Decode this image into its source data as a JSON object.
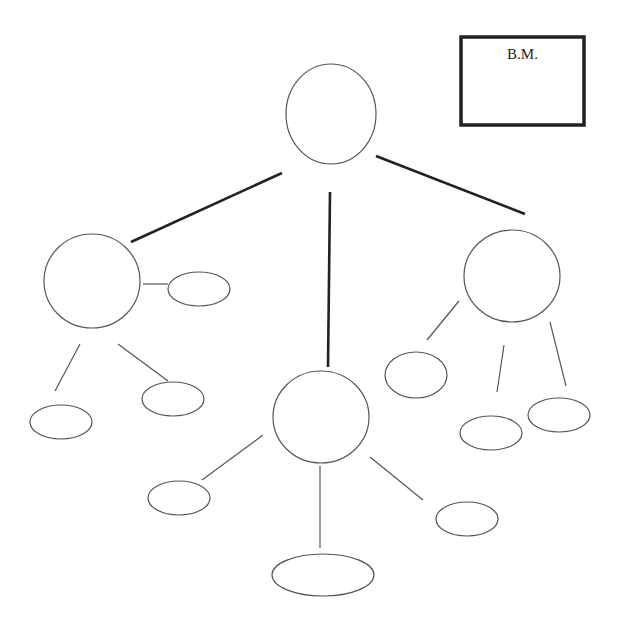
{
  "diagram": {
    "title_box": {
      "label": "B.M.",
      "x": 461,
      "y": 37,
      "w": 123,
      "h": 88,
      "stroke_width": 3.5,
      "color": "#222222"
    },
    "nodes": [
      {
        "id": "root",
        "shape": "ellipse",
        "cx": 331,
        "cy": 114,
        "rx": 45,
        "ry": 50
      },
      {
        "id": "left",
        "shape": "ellipse",
        "cx": 92,
        "cy": 281,
        "rx": 48,
        "ry": 47
      },
      {
        "id": "middle",
        "shape": "ellipse",
        "cx": 321,
        "cy": 417,
        "rx": 48,
        "ry": 46
      },
      {
        "id": "right",
        "shape": "ellipse",
        "cx": 512,
        "cy": 276,
        "rx": 48,
        "ry": 46
      },
      {
        "id": "left-child-right",
        "shape": "ellipse",
        "cx": 199,
        "cy": 289,
        "rx": 31,
        "ry": 17
      },
      {
        "id": "left-child-bottom-left",
        "shape": "ellipse",
        "cx": 61,
        "cy": 422,
        "rx": 31,
        "ry": 17
      },
      {
        "id": "left-child-bottom-right",
        "shape": "ellipse",
        "cx": 173,
        "cy": 399,
        "rx": 31,
        "ry": 17
      },
      {
        "id": "middle-child-left",
        "shape": "ellipse",
        "cx": 179,
        "cy": 498,
        "rx": 31,
        "ry": 17
      },
      {
        "id": "middle-child-bottom",
        "shape": "ellipse",
        "cx": 323,
        "cy": 575,
        "rx": 51,
        "ry": 21
      },
      {
        "id": "middle-child-right",
        "shape": "ellipse",
        "cx": 467,
        "cy": 519,
        "rx": 31,
        "ry": 17
      },
      {
        "id": "right-child-left",
        "shape": "ellipse",
        "cx": 416,
        "cy": 375,
        "rx": 31,
        "ry": 23
      },
      {
        "id": "right-child-bottom",
        "shape": "ellipse",
        "cx": 491,
        "cy": 433,
        "rx": 31,
        "ry": 17
      },
      {
        "id": "right-child-right",
        "shape": "ellipse",
        "cx": 559,
        "cy": 415,
        "rx": 31,
        "ry": 17
      }
    ],
    "edges": [
      {
        "from": "root",
        "to": "left",
        "x1": 282,
        "y1": 173,
        "x2": 131,
        "y2": 242,
        "thick": true
      },
      {
        "from": "root",
        "to": "middle",
        "x1": 330,
        "y1": 192,
        "x2": 328,
        "y2": 367,
        "thick": true
      },
      {
        "from": "root",
        "to": "right",
        "x1": 376,
        "y1": 156,
        "x2": 525,
        "y2": 214,
        "thick": true
      },
      {
        "from": "left",
        "to": "left-child-right",
        "x1": 143,
        "y1": 284,
        "x2": 168,
        "y2": 284,
        "thick": false
      },
      {
        "from": "left",
        "to": "left-child-bottom-left",
        "x1": 80,
        "y1": 344,
        "x2": 55,
        "y2": 391,
        "thick": false
      },
      {
        "from": "left",
        "to": "left-child-bottom-right",
        "x1": 118,
        "y1": 344,
        "x2": 168,
        "y2": 381,
        "thick": false
      },
      {
        "from": "middle",
        "to": "middle-child-left",
        "x1": 263,
        "y1": 435,
        "x2": 202,
        "y2": 480,
        "thick": false
      },
      {
        "from": "middle",
        "to": "middle-child-bottom",
        "x1": 320,
        "y1": 466,
        "x2": 320,
        "y2": 548,
        "thick": false
      },
      {
        "from": "middle",
        "to": "middle-child-right",
        "x1": 370,
        "y1": 457,
        "x2": 423,
        "y2": 500,
        "thick": false
      },
      {
        "from": "right",
        "to": "right-child-left",
        "x1": 459,
        "y1": 301,
        "x2": 427,
        "y2": 340,
        "thick": false
      },
      {
        "from": "right",
        "to": "right-child-bottom",
        "x1": 504,
        "y1": 345,
        "x2": 497,
        "y2": 392,
        "thick": false
      },
      {
        "from": "right",
        "to": "right-child-right",
        "x1": 550,
        "y1": 322,
        "x2": 566,
        "y2": 386,
        "thick": false
      }
    ],
    "colors": {
      "node_stroke": "#555555",
      "thin_edge": "#555555",
      "thick_edge": "#222222",
      "background": "#ffffff"
    }
  }
}
